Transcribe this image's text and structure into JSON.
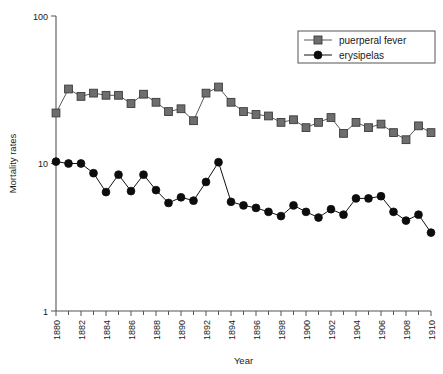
{
  "chart_data": {
    "type": "line",
    "title": "",
    "xlabel": "Year",
    "ylabel": "Mortality rates",
    "yscale": "log",
    "ylim": [
      1,
      100
    ],
    "xlim": [
      1880,
      1910
    ],
    "grid": false,
    "legend_position": "top-right",
    "y_ticks": [
      "100",
      "10",
      "1"
    ],
    "y_tick_values": [
      100,
      10,
      1
    ],
    "x_ticks": [
      "1880",
      "1882",
      "1884",
      "1886",
      "1888",
      "1890",
      "1892",
      "1894",
      "1896",
      "1898",
      "1900",
      "1902",
      "1904",
      "1906",
      "1908",
      "1910"
    ],
    "x_tick_values": [
      1880,
      1882,
      1884,
      1886,
      1888,
      1890,
      1892,
      1894,
      1896,
      1898,
      1900,
      1902,
      1904,
      1906,
      1908,
      1910
    ],
    "x_minor_tick_values": [
      1881,
      1883,
      1885,
      1887,
      1889,
      1891,
      1893,
      1895,
      1897,
      1899,
      1901,
      1903,
      1905,
      1907,
      1909
    ],
    "x": [
      1880,
      1881,
      1882,
      1883,
      1884,
      1885,
      1886,
      1887,
      1888,
      1889,
      1890,
      1891,
      1892,
      1893,
      1894,
      1895,
      1896,
      1897,
      1898,
      1899,
      1900,
      1901,
      1902,
      1903,
      1904,
      1905,
      1906,
      1907,
      1908,
      1909,
      1910
    ],
    "series": [
      {
        "name": "puerperal fever",
        "marker": "square",
        "color": "#6e6e6e",
        "values": [
          22.0,
          32.0,
          28.5,
          30.0,
          29.0,
          29.0,
          25.5,
          29.5,
          26.0,
          22.5,
          23.5,
          19.5,
          30.0,
          33.0,
          26.0,
          22.5,
          21.5,
          21.0,
          19.0,
          19.8,
          17.5,
          19.0,
          20.5,
          16.0,
          19.0,
          17.5,
          18.5,
          16.2,
          14.5,
          18.0,
          16.2
        ]
      },
      {
        "name": "erysipelas",
        "marker": "circle",
        "color": "#0d0d0d",
        "values": [
          10.3,
          10.0,
          10.0,
          8.6,
          6.4,
          8.4,
          6.5,
          8.4,
          6.6,
          5.4,
          5.9,
          5.6,
          7.5,
          10.2,
          5.5,
          5.2,
          5.0,
          4.7,
          4.4,
          5.2,
          4.7,
          4.3,
          4.9,
          4.5,
          5.8,
          5.8,
          6.0,
          4.7,
          4.1,
          4.5,
          3.4
        ]
      }
    ]
  },
  "legend": {
    "entries": [
      {
        "label": "puerperal fever"
      },
      {
        "label": "erysipelas"
      }
    ]
  }
}
